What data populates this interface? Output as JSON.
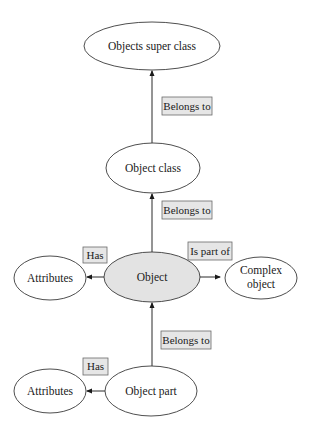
{
  "diagram": {
    "type": "object-relationship",
    "nodes": {
      "super_class": {
        "label": "Objects super class",
        "cx": 152,
        "cy": 46,
        "rx": 68,
        "ry": 24,
        "highlight": false
      },
      "object_class": {
        "label": "Object class",
        "cx": 153,
        "cy": 168,
        "rx": 47,
        "ry": 25,
        "highlight": false
      },
      "object": {
        "label": "Object",
        "cx": 152,
        "cy": 277,
        "rx": 48,
        "ry": 25,
        "highlight": true
      },
      "attributes_top": {
        "label": "Attributes",
        "cx": 50,
        "cy": 278,
        "rx": 36,
        "ry": 22,
        "highlight": false
      },
      "complex_object": {
        "label_line1": "Complex",
        "label_line2": "object",
        "cx": 261,
        "cy": 278,
        "rx": 36,
        "ry": 21,
        "highlight": false
      },
      "object_part": {
        "label": "Object part",
        "cx": 151,
        "cy": 391,
        "rx": 46,
        "ry": 25,
        "highlight": false
      },
      "attributes_bottom": {
        "label": "Attributes",
        "cx": 50,
        "cy": 391,
        "rx": 36,
        "ry": 22,
        "highlight": false
      }
    },
    "edges": [
      {
        "from": "object_class",
        "to": "super_class",
        "label": "Belongs to"
      },
      {
        "from": "object",
        "to": "object_class",
        "label": "Belongs to"
      },
      {
        "from": "object",
        "to": "attributes_top",
        "label": "Has"
      },
      {
        "from": "object",
        "to": "complex_object",
        "label": "Is part of"
      },
      {
        "from": "object_part",
        "to": "object",
        "label": "Belongs to"
      },
      {
        "from": "object_part",
        "to": "attributes_bottom",
        "label": "Has"
      }
    ],
    "edge_labels": {
      "belongs_to_1": "Belongs to",
      "belongs_to_2": "Belongs to",
      "belongs_to_3": "Belongs to",
      "has_1": "Has",
      "has_2": "Has",
      "is_part_of": "Is part of"
    },
    "colors": {
      "highlight_fill": "#e3e3e3",
      "label_box_fill": "#e6e6e6",
      "stroke": "#3a3a3a"
    }
  }
}
